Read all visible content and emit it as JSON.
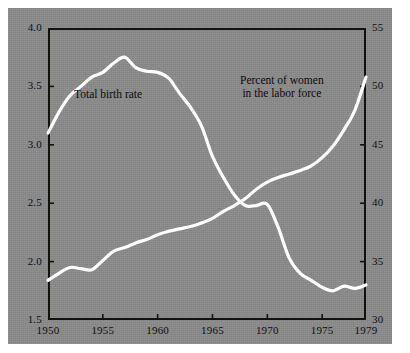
{
  "figure": {
    "background_color": "#ffffff",
    "plate_color": "#8b8b8b",
    "line_color": "#ffffff",
    "axis_color": "#14120f"
  },
  "chart_data": {
    "type": "line",
    "title": "",
    "subtitle": "",
    "xlabel": "",
    "ylabel": "",
    "grid": false,
    "legend_position": "inline-annotations",
    "x": [
      1950,
      1951,
      1952,
      1953,
      1954,
      1955,
      1956,
      1957,
      1958,
      1959,
      1960,
      1961,
      1962,
      1963,
      1964,
      1965,
      1966,
      1967,
      1968,
      1969,
      1970,
      1971,
      1972,
      1973,
      1974,
      1975,
      1976,
      1977,
      1978,
      1979
    ],
    "xlim": [
      1950,
      1979
    ],
    "xticks": [
      1950,
      1955,
      1960,
      1965,
      1970,
      1975,
      1979
    ],
    "xticklabels": [
      "1950",
      "1955",
      "1960",
      "1965",
      "1970",
      "1975",
      "1979"
    ],
    "axes": [
      {
        "side": "left",
        "name": "Total birth rate",
        "ylim": [
          1.5,
          4.0
        ],
        "yticks": [
          1.5,
          2.0,
          2.5,
          3.0,
          3.5,
          4.0
        ],
        "yticklabels": [
          "1.5",
          "2.0",
          "2.5",
          "3.0",
          "3.5",
          "4.0"
        ]
      },
      {
        "side": "right",
        "name": "Percent of women in the labor force",
        "ylim": [
          30,
          55
        ],
        "yticks": [
          30,
          35,
          40,
          45,
          50,
          55
        ],
        "yticklabels": [
          "30",
          "35",
          "40",
          "45",
          "50",
          "55"
        ]
      }
    ],
    "series": [
      {
        "name": "Total birth rate",
        "axis": "left",
        "label_text": "Total birth rate",
        "color": "#ffffff",
        "values": [
          3.1,
          3.28,
          3.42,
          3.5,
          3.58,
          3.62,
          3.7,
          3.75,
          3.66,
          3.63,
          3.62,
          3.57,
          3.44,
          3.32,
          3.16,
          2.9,
          2.72,
          2.57,
          2.48,
          2.48,
          2.49,
          2.29,
          2.03,
          1.9,
          1.84,
          1.78,
          1.75,
          1.79,
          1.77,
          1.8
        ]
      },
      {
        "name": "Percent of women in the labor force",
        "axis": "right",
        "label_text_line1": "Percent of women",
        "label_text_line2": "in the labor force",
        "color": "#ffffff",
        "values": [
          33.4,
          34.0,
          34.5,
          34.4,
          34.3,
          35.1,
          35.9,
          36.2,
          36.6,
          36.9,
          37.3,
          37.6,
          37.8,
          38.0,
          38.3,
          38.7,
          39.3,
          39.8,
          40.4,
          41.2,
          41.8,
          42.2,
          42.5,
          42.8,
          43.2,
          43.9,
          44.9,
          46.3,
          48.0,
          50.8
        ]
      }
    ],
    "annotations": [
      {
        "text": "Total birth rate",
        "series": "Total birth rate"
      },
      {
        "text": "Percent of women in the labor force",
        "series": "Percent of women in the labor force"
      }
    ]
  }
}
